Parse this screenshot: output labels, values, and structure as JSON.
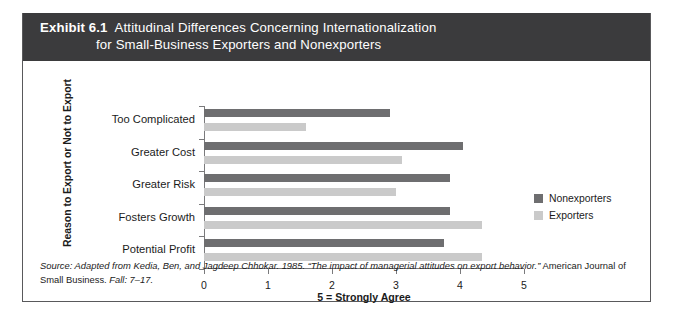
{
  "exhibit": {
    "number_label": "Exhibit 6.1",
    "title_line1": "Attitudinal Differences Concerning Internationalization",
    "title_line2": "for Small-Business Exporters and Nonexporters"
  },
  "source_note": {
    "italic_part": "Source: Adapted from Kedia, Ben, and Jagdeep Chhokar. 1985. “The impact of managerial attitudes on export behavior.”",
    "roman_part": " American Journal of Small Business.",
    "italic_tail": " Fall: 7–17."
  },
  "legend": {
    "items": [
      {
        "label": "Nonexporters",
        "color": "#6e6e70"
      },
      {
        "label": "Exporters",
        "color": "#cacaca"
      }
    ]
  },
  "chart_data": {
    "type": "bar",
    "orientation": "horizontal",
    "title": "Attitudinal Differences Concerning Internationalization for Small-Business Exporters and Nonexporters",
    "xlabel": "5 = Strongly Agree",
    "ylabel": "Reason to Export or Not to Export",
    "categories": [
      "Too Complicated",
      "Greater Cost",
      "Greater Risk",
      "Fosters Growth",
      "Potential Profit"
    ],
    "series": [
      {
        "name": "Nonexporters",
        "color": "#6e6e70",
        "values": [
          2.9,
          4.05,
          3.85,
          3.85,
          3.75
        ]
      },
      {
        "name": "Exporters",
        "color": "#cacaca",
        "values": [
          1.6,
          3.1,
          3.0,
          4.35,
          4.35
        ]
      }
    ],
    "xlim": [
      0,
      5
    ],
    "xticks": [
      0,
      1,
      2,
      3,
      4,
      5
    ],
    "xtick_labels": [
      "0",
      "1",
      "2",
      "3",
      "4",
      "5"
    ],
    "grid": false,
    "legend_position": "right"
  }
}
